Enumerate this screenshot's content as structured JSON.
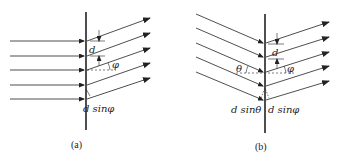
{
  "figure": {
    "panels": [
      {
        "id": "a",
        "caption": "(a)",
        "spacing_label": "d",
        "angle_label": "φ",
        "path_diff_label": "d sinφ",
        "incident": "normal",
        "rays": 5
      },
      {
        "id": "b",
        "caption": "(b)",
        "spacing_label": "d",
        "incident_angle_label": "θ",
        "angle_label": "φ",
        "path_diff_in_label": "d sinθ",
        "path_diff_out_label": "d sinφ",
        "incident": "oblique",
        "rays": 5
      }
    ],
    "colors": {
      "ink": "#222222",
      "background": "#ffffff"
    }
  }
}
